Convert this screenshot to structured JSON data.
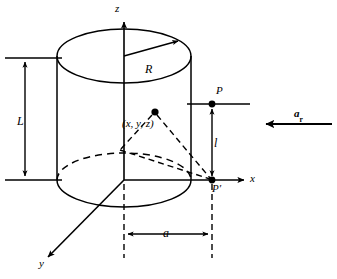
{
  "figure": {
    "kind": "geometry-diagram",
    "stroke_color": "#000000",
    "background_color": "#ffffff"
  },
  "axes": {
    "z_label": "z",
    "x_label": "x",
    "y_label": "y"
  },
  "cylinder": {
    "radius_label": "R",
    "length_label": "L"
  },
  "points": {
    "field_point_label": "P",
    "projected_point_label": "P′",
    "source_point_label": "(x, y, z)"
  },
  "dimensions": {
    "radial_distance_label": "a",
    "height_label": "l"
  },
  "vectors": {
    "radial_unit_vector_label": "a",
    "radial_unit_vector_subscript": "r"
  }
}
